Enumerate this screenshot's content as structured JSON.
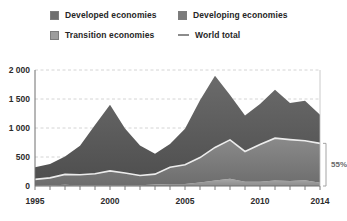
{
  "legend": {
    "items": [
      {
        "label": "Developed economies",
        "icon": "square-swatch-icon",
        "color": "#6f6f6f"
      },
      {
        "label": "Developing economies",
        "icon": "square-swatch-icon",
        "color": "#7b7b7b"
      },
      {
        "label": "Transition economies",
        "icon": "square-swatch-icon",
        "color": "#9d9d9d"
      },
      {
        "label": "World total",
        "icon": "line-swatch-icon",
        "color": "#e8e8e8"
      }
    ]
  },
  "annotation": {
    "share_label": "55%"
  },
  "chart_data": {
    "type": "area",
    "stacked": true,
    "title": "",
    "subtitle": "",
    "xlabel": "",
    "ylabel": "",
    "grid": true,
    "legend_position": "top",
    "xlim": [
      1995,
      2014
    ],
    "ylim": [
      0,
      2000
    ],
    "yticks": [
      0,
      500,
      1000,
      1500,
      2000
    ],
    "ytick_labels": [
      "0",
      "500",
      "1 000",
      "1 500",
      "2 000"
    ],
    "xticks": [
      1995,
      2000,
      2005,
      2010,
      2014
    ],
    "xtick_labels": [
      "1995",
      "2000",
      "2005",
      "2010",
      "2014"
    ],
    "x": [
      1995,
      1996,
      1997,
      1998,
      1999,
      2000,
      2001,
      2002,
      2003,
      2004,
      2005,
      2006,
      2007,
      2008,
      2009,
      2010,
      2011,
      2012,
      2013,
      2014
    ],
    "series": [
      {
        "name": "Transition economies",
        "color": "#9d9d9d",
        "stack_order": 1,
        "values": [
          5,
          10,
          20,
          10,
          10,
          10,
          10,
          15,
          25,
          35,
          35,
          60,
          95,
          125,
          75,
          75,
          95,
          85,
          100,
          55
        ]
      },
      {
        "name": "Developing economies",
        "color": "#7b7b7b",
        "stack_order": 2,
        "values": [
          110,
          130,
          180,
          185,
          200,
          250,
          215,
          165,
          180,
          290,
          330,
          430,
          570,
          670,
          520,
          640,
          730,
          715,
          680,
          680
        ]
      },
      {
        "name": "Developed economies",
        "color": "#5d5d5d",
        "stack_order": 3,
        "values": [
          210,
          240,
          310,
          500,
          840,
          1140,
          765,
          520,
          350,
          400,
          620,
          990,
          1235,
          775,
          620,
          700,
          835,
          630,
          690,
          495
        ]
      }
    ],
    "overlay_line": {
      "name": "World total",
      "color": "#ececec",
      "note": "drawn as the boundary on top of the developing + transition stack",
      "values": [
        115,
        140,
        200,
        195,
        210,
        260,
        225,
        180,
        205,
        325,
        365,
        490,
        665,
        795,
        595,
        715,
        825,
        800,
        780,
        735
      ]
    },
    "annotations": [
      {
        "text": "55%",
        "type": "bracket",
        "x": 2014,
        "y_from": 0,
        "y_to": 735,
        "meaning": "developing plus transition economies share of world total in 2014"
      }
    ]
  }
}
